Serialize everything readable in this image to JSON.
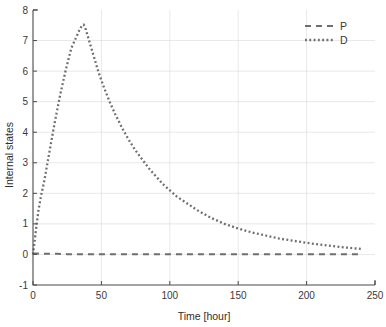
{
  "chart_data": {
    "type": "line",
    "title": "",
    "xlabel": "Time [hour]",
    "ylabel": "Internal states",
    "xlim": [
      0,
      250
    ],
    "ylim": [
      -1,
      8
    ],
    "xticks": [
      0,
      50,
      100,
      150,
      200,
      250
    ],
    "yticks": [
      -1,
      0,
      1,
      2,
      3,
      4,
      5,
      6,
      7,
      8
    ],
    "xticklabels": [
      "0",
      "50",
      "100",
      "150",
      "200",
      "250"
    ],
    "yticklabels": [
      "-1",
      "0",
      "1",
      "2",
      "3",
      "4",
      "5",
      "6",
      "7",
      "8"
    ],
    "grid": true,
    "legend_position": "upper right",
    "series": [
      {
        "name": "P",
        "linestyle": "dashed",
        "color": "#6e6e6e",
        "x": [
          0,
          1,
          2,
          3,
          5,
          8,
          12,
          18,
          25,
          35,
          45,
          60,
          80,
          100,
          120,
          140,
          160,
          180,
          200,
          220,
          240
        ],
        "y": [
          0.02,
          0.03,
          0.03,
          0.03,
          0.02,
          0.02,
          0.02,
          0.02,
          0.01,
          0.01,
          0.01,
          0.01,
          0.01,
          0.01,
          0.01,
          0.01,
          0.01,
          0.01,
          0.01,
          0.01,
          0.01
        ]
      },
      {
        "name": "D",
        "linestyle": "dotted",
        "color": "#6e6e6e",
        "x": [
          0,
          1,
          2,
          3,
          4,
          5,
          6,
          7,
          8,
          9,
          10,
          12,
          14,
          16,
          18,
          20,
          22,
          24,
          26,
          28,
          30,
          32,
          34,
          36,
          37,
          38,
          40,
          42,
          45,
          48,
          52,
          56,
          60,
          65,
          70,
          75,
          80,
          85,
          90,
          95,
          100,
          105,
          110,
          115,
          120,
          130,
          140,
          150,
          160,
          170,
          180,
          190,
          200,
          210,
          220,
          230,
          240
        ],
        "y": [
          0.0,
          0.35,
          0.75,
          1.1,
          1.45,
          1.7,
          1.95,
          2.15,
          2.35,
          2.6,
          2.85,
          3.35,
          3.85,
          4.35,
          4.8,
          5.25,
          5.65,
          6.05,
          6.4,
          6.75,
          6.95,
          7.15,
          7.35,
          7.5,
          7.52,
          7.45,
          7.15,
          6.85,
          6.4,
          5.95,
          5.45,
          5.0,
          4.6,
          4.15,
          3.75,
          3.4,
          3.1,
          2.8,
          2.55,
          2.3,
          2.1,
          1.9,
          1.75,
          1.6,
          1.45,
          1.2,
          1.0,
          0.85,
          0.72,
          0.62,
          0.52,
          0.45,
          0.38,
          0.32,
          0.27,
          0.22,
          0.18
        ]
      }
    ],
    "legend": [
      {
        "label": "P",
        "style": "dashed"
      },
      {
        "label": "D",
        "style": "dotted"
      }
    ]
  },
  "axes": {
    "x_title": "Time [hour]",
    "y_title": "Internal states"
  },
  "colors": {
    "series": "#6e6e6e",
    "axis": "#4a4a4a",
    "grid": "#d9d9d9",
    "background": "#ffffff"
  }
}
